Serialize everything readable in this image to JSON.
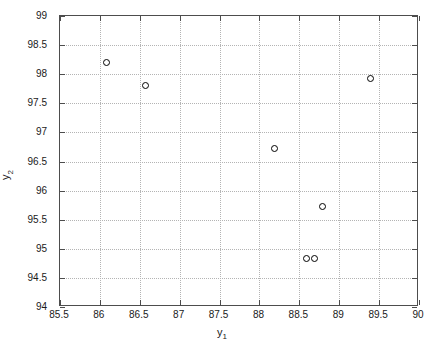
{
  "chart_data": {
    "type": "scatter",
    "title": "",
    "xlabel": "y_1",
    "ylabel": "y_2",
    "xlabel_base": "y",
    "xlabel_sub": "1",
    "ylabel_base": "y",
    "ylabel_sub": "2",
    "xlim": [
      85.5,
      90
    ],
    "ylim": [
      94,
      99
    ],
    "grid": true,
    "legend": null,
    "marker": "open-circle",
    "marker_color": "#000000",
    "xticks": [
      85.5,
      86,
      86.5,
      87,
      87.5,
      88,
      88.5,
      89,
      89.5,
      90
    ],
    "xticklabels": [
      "85.5",
      "86",
      "86.5",
      "87",
      "87.5",
      "88",
      "88.5",
      "89",
      "89.5",
      "90"
    ],
    "yticks": [
      94,
      94.5,
      95,
      95.5,
      96,
      96.5,
      97,
      97.5,
      98,
      98.5,
      99
    ],
    "yticklabels": [
      "94",
      "94.5",
      "95",
      "95.5",
      "96",
      "96.5",
      "97",
      "97.5",
      "98",
      "98.5",
      "99"
    ],
    "points": [
      {
        "x": 86.08,
        "y": 98.2
      },
      {
        "x": 86.57,
        "y": 97.8
      },
      {
        "x": 88.19,
        "y": 96.72
      },
      {
        "x": 89.39,
        "y": 97.93
      },
      {
        "x": 88.79,
        "y": 95.72
      },
      {
        "x": 88.59,
        "y": 94.83
      },
      {
        "x": 88.69,
        "y": 94.83
      }
    ],
    "x": [
      86.08,
      86.57,
      88.19,
      89.39,
      88.79,
      88.59,
      88.69
    ],
    "y": [
      98.2,
      97.8,
      96.72,
      97.93,
      95.72,
      94.83,
      94.83
    ]
  },
  "figure": {
    "background_color": "#ffffff",
    "axis_color": "#4d4d4d",
    "grid_color": "#b4b4b4"
  }
}
